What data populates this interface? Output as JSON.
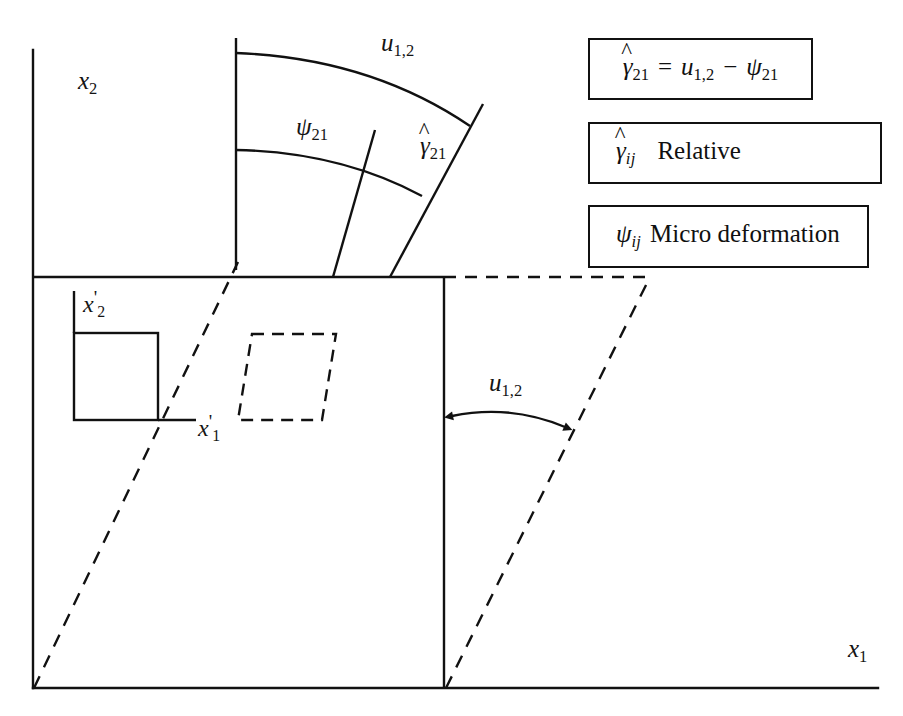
{
  "figure": {
    "type": "technical-line-diagram",
    "background_color": "#ffffff",
    "line_color": "#111111"
  },
  "axes": {
    "x2_label": {
      "symbol": "x",
      "sub": "2"
    },
    "x1_label": {
      "symbol": "x",
      "sub": "1"
    },
    "x2_prime_label": {
      "symbol": "x",
      "sub": "2",
      "prime": "'"
    },
    "x1_prime_label": {
      "symbol": "x",
      "sub": "1",
      "prime": "'"
    }
  },
  "fan_diagram": {
    "outer_arc_label": {
      "symbol": "u",
      "sub": "1,2"
    },
    "inner_arc_label": {
      "symbol": "ψ",
      "sub": "21"
    },
    "wedge_label": {
      "symbol": "γ",
      "hat": "^",
      "sub": "21"
    }
  },
  "displacement_arrow": {
    "label": {
      "symbol": "u",
      "sub": "1,2"
    },
    "style": "double-headed-curved-arrow"
  },
  "legend": {
    "boxes": [
      {
        "id": "relative-deformation-equation",
        "parts": {
          "lhs_symbol": "γ",
          "lhs_hat": "^",
          "lhs_sub": "21",
          "equals": "=",
          "term1_symbol": "u",
          "term1_sub": "1,2",
          "minus": "−",
          "term2_symbol": "ψ",
          "term2_sub": "21"
        },
        "plain_text": "γ̂21 = u1,2 − ψ21"
      },
      {
        "id": "relative-definition",
        "parts": {
          "symbol": "γ",
          "hat": "^",
          "sub": "ij",
          "description": "Relative"
        },
        "plain_text": "γ̂ij  Relative"
      },
      {
        "id": "micro-deformation-definition",
        "parts": {
          "symbol": "ψ",
          "sub": "ij",
          "description": "Micro deformation"
        },
        "plain_text": "ψij  Micro deformation"
      }
    ]
  },
  "shapes": {
    "undeformed_square": {
      "style": "solid",
      "description": "reference square element"
    },
    "deformed_parallelogram_left": {
      "style": "dashed",
      "description": "sheared element"
    },
    "deformed_parallelogram_right": {
      "style": "dashed",
      "description": "sheared body outline"
    }
  }
}
